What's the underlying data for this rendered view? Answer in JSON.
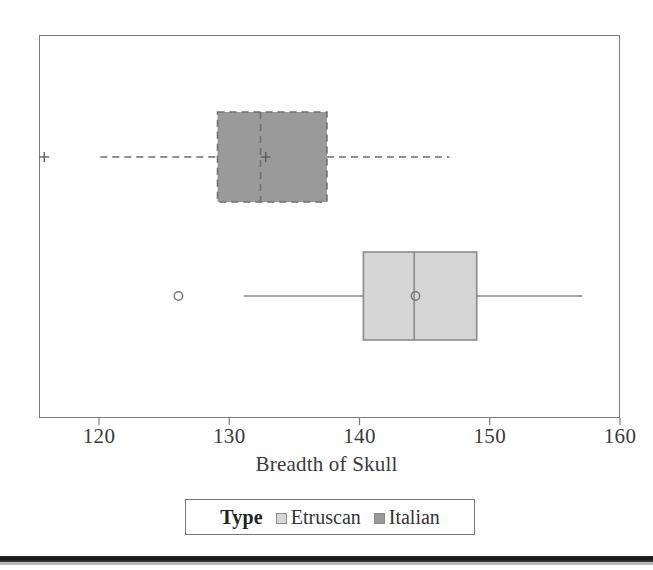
{
  "chart_data": {
    "type": "box",
    "orientation": "horizontal",
    "title": "",
    "xlabel": "Breadth of Skull",
    "ylabel": "",
    "xlim": [
      115.2,
      161.6
    ],
    "xticks": [
      120,
      130,
      140,
      150,
      160
    ],
    "xticklabels": [
      "120",
      "130",
      "140",
      "150",
      "160"
    ],
    "grid": false,
    "legend": {
      "title": "Type",
      "position": "bottom-center",
      "entries": [
        {
          "label": "Etruscan",
          "color": "#d6d6d6"
        },
        {
          "label": "Italian",
          "color": "#9a9a9a"
        }
      ]
    },
    "series": [
      {
        "name": "Italian",
        "row": 0,
        "color": "#9a9a9a",
        "edge_color": "#6e6e6e",
        "line_style": "dashed",
        "marker": "plus",
        "q1": 129.1,
        "median": 132.4,
        "q3": 137.5,
        "whisker_low": 120.1,
        "whisker_high": 146.9,
        "mean": 132.8,
        "outliers": [
          115.8
        ]
      },
      {
        "name": "Etruscan",
        "row": 1,
        "color": "#d6d6d6",
        "edge_color": "#8a8a8a",
        "line_style": "solid",
        "marker": "circle",
        "q1": 140.3,
        "median": 144.2,
        "q3": 149.0,
        "whisker_low": 131.1,
        "whisker_high": 157.1,
        "mean": 144.3,
        "outliers": [
          126.1
        ]
      }
    ]
  },
  "axis": {
    "title": "Breadth of Skull",
    "ticks": [
      "120",
      "130",
      "140",
      "150",
      "160"
    ]
  },
  "legend": {
    "title": "Type",
    "etruscan_label": "Etruscan",
    "italian_label": "Italian"
  },
  "colors": {
    "italian_fill": "#9a9a9a",
    "italian_edge": "#6e6e6e",
    "etruscan_fill": "#d6d6d6",
    "etruscan_edge": "#8a8a8a",
    "frame": "#7c7c7c",
    "text": "#3a3a3a"
  }
}
